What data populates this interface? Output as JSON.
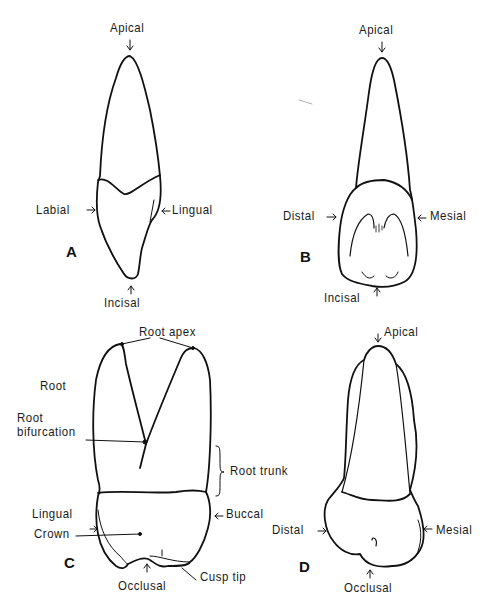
{
  "figure": {
    "panels": [
      {
        "id": "A",
        "letter": "A",
        "labels": {
          "top": "Apical",
          "left": "Labial",
          "right": "Lingual",
          "bottom": "Incisal"
        }
      },
      {
        "id": "B",
        "letter": "B",
        "labels": {
          "top": "Apical",
          "left": "Distal",
          "right": "Mesial",
          "bottom": "Incisal"
        }
      },
      {
        "id": "C",
        "letter": "C",
        "labels": {
          "root_apex": "Root apex",
          "root": "Root",
          "root_bifurcation_1": "Root",
          "root_bifurcation_2": "bifurcation",
          "root_trunk": "Root trunk",
          "left": "Lingual",
          "right": "Buccal",
          "crown": "Crown",
          "bottom": "Occlusal",
          "cusp_tip": "Cusp tip"
        }
      },
      {
        "id": "D",
        "letter": "D",
        "labels": {
          "top": "Apical",
          "left": "Distal",
          "right": "Mesial",
          "bottom": "Occlusal"
        }
      }
    ],
    "line_color": "#111111",
    "background": "#ffffff"
  }
}
